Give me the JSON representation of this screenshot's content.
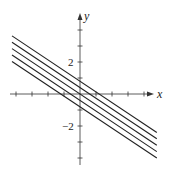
{
  "chart_data": {
    "type": "line",
    "title": "",
    "xlabel": "x",
    "ylabel": "y",
    "x_ticks": [
      -4,
      -3,
      -2,
      -1,
      1,
      2,
      3,
      4
    ],
    "y_ticks": [
      -4,
      -3,
      -2,
      -1,
      1,
      2,
      3,
      4
    ],
    "labeled_ticks": [
      {
        "axis": "y",
        "value": 2,
        "label": "2"
      },
      {
        "axis": "y",
        "value": -2,
        "label": "−2"
      }
    ],
    "grid": false,
    "xlim": [
      -4.4,
      4.6
    ],
    "ylim": [
      -4.5,
      5.0
    ],
    "series": [
      {
        "name": "line 1",
        "slope": -0.667,
        "intercept": 0.8,
        "x": [
          -4.25,
          4.8
        ]
      },
      {
        "name": "line 2",
        "slope": -0.667,
        "intercept": 0.4,
        "x": [
          -4.25,
          4.8
        ]
      },
      {
        "name": "line 3",
        "slope": -0.667,
        "intercept": 0.0,
        "x": [
          -4.25,
          4.8
        ]
      },
      {
        "name": "line 4",
        "slope": -0.667,
        "intercept": -0.4,
        "x": [
          -4.25,
          4.8
        ]
      },
      {
        "name": "line 5",
        "slope": -0.667,
        "intercept": -0.8,
        "x": [
          -4.25,
          4.8
        ]
      }
    ],
    "colors": {
      "axes": "#333333",
      "lines": "#222222"
    }
  },
  "labels": {
    "x_axis": "x",
    "y_axis": "y",
    "y_tick_pos2": "2",
    "y_tick_neg2": "−2"
  }
}
